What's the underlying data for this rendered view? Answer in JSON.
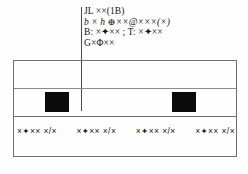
{
  "document": {
    "type": "scanned-technical-drawing",
    "background_color": "#fefefe",
    "ink_color": "#1a1a1a"
  },
  "callout": {
    "lines": [
      {
        "text": "JL ××(1B)",
        "style": "roman"
      },
      {
        "text": "b × h  ⊕××@×××(×)",
        "style": "italic"
      },
      {
        "text": "B: ×✦×× ; T: ×✦××",
        "style": "roman"
      },
      {
        "text": "G×Φ××",
        "style": "roman"
      }
    ],
    "leader_line_color": "#4a4a4a"
  },
  "table": {
    "border_color": "#707070",
    "divider_color": "#8a8a8a",
    "rows": [
      {
        "name": "upper-band",
        "content": ""
      },
      {
        "name": "middle-band",
        "content": ""
      },
      {
        "name": "lower-band",
        "content": ""
      }
    ]
  },
  "markers": [
    {
      "name": "marker-left",
      "color": "#0b0b0b"
    },
    {
      "name": "marker-right",
      "color": "#0b0b0b"
    }
  ],
  "label_strip": {
    "cells": [
      "×✦×× ×/×",
      "×✦×× ×/×",
      "×✦×× ×/×",
      "×✦×× ×/×"
    ]
  }
}
